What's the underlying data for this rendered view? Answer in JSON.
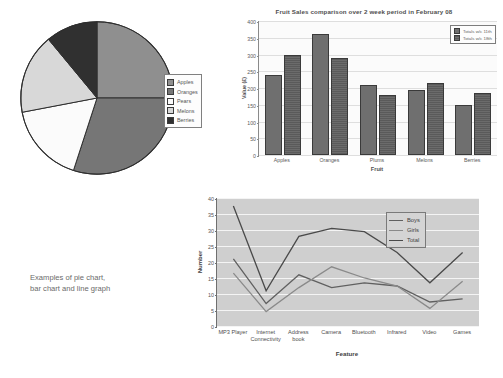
{
  "caption": {
    "line1": "Examples of pie chart,",
    "line2": "bar chart and line graph"
  },
  "chart_data": [
    {
      "type": "pie",
      "title": "",
      "legend_position": "right",
      "categories": [
        "Apples",
        "Oranges",
        "Pears",
        "Melons",
        "Berries"
      ],
      "values": [
        25,
        30,
        17,
        17,
        11
      ],
      "colors": [
        "#8f8f8f",
        "#767676",
        "#fbfbfb",
        "#d8d8d8",
        "#303030"
      ]
    },
    {
      "type": "bar",
      "title": "Fruit Sales comparison over 2 week period in February 08",
      "xlabel": "Fruit",
      "ylabel": "Value (£)",
      "ylim": [
        0,
        400
      ],
      "yticks": [
        0,
        50,
        100,
        150,
        200,
        250,
        300,
        350,
        400
      ],
      "grid": true,
      "legend_position": "top-right",
      "categories": [
        "Apples",
        "Oranges",
        "Plums",
        "Melons",
        "Berries"
      ],
      "series": [
        {
          "name": "Totals w/c 11th",
          "values": [
            240,
            360,
            210,
            195,
            150
          ],
          "color": "#6f6f6f"
        },
        {
          "name": "Totals w/c 18th",
          "values": [
            300,
            290,
            180,
            215,
            185
          ],
          "color": "#6b6b6b"
        }
      ]
    },
    {
      "type": "line",
      "title": "",
      "xlabel": "Feature",
      "ylabel": "Number",
      "ylim": [
        0,
        40
      ],
      "yticks": [
        0,
        5,
        10,
        15,
        20,
        25,
        30,
        35,
        40
      ],
      "grid": true,
      "legend_position": "right",
      "x": [
        "MP3 Player",
        "Internet Connectivity",
        "Address book",
        "Camera",
        "Bluetooth",
        "Infrared",
        "Video",
        "Games"
      ],
      "series": [
        {
          "name": "Boys",
          "values": [
            21,
            7,
            16,
            12,
            13.5,
            12.5,
            7.5,
            8.5
          ],
          "color": "#606060"
        },
        {
          "name": "Girls",
          "values": [
            16.5,
            4.5,
            12,
            18.5,
            15,
            12.5,
            5.5,
            14
          ],
          "color": "#8a8a8a"
        },
        {
          "name": "Total",
          "values": [
            37.5,
            11,
            28,
            30.5,
            29.5,
            23,
            13.5,
            23
          ],
          "color": "#4a4a4a"
        }
      ]
    }
  ]
}
